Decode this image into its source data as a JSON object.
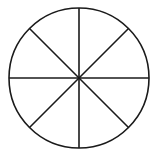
{
  "diagram": {
    "type": "circle-divided-into-sectors",
    "sectors": 8,
    "center": {
      "x": 79,
      "y": 78
    },
    "radius": 70,
    "stroke_color": "#1a1a1a",
    "background_color": "#ffffff",
    "stroke_width": 1.6,
    "divider_angles_deg": [
      0,
      45,
      90,
      135
    ]
  }
}
